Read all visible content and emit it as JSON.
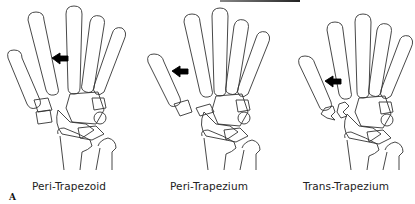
{
  "figure": {
    "label": "A",
    "panels": [
      {
        "caption": "Peri-Trapezoid",
        "injury": "peri-trapezoid",
        "arrow_direction": "left"
      },
      {
        "caption": "Peri-Trapezium",
        "injury": "peri-trapezium",
        "arrow_direction": "left"
      },
      {
        "caption": "Trans-Trapezium",
        "injury": "trans-trapezium",
        "arrow_direction": "left"
      }
    ],
    "colors": {
      "line": "#333333",
      "arrow": "#000000",
      "background": "#ffffff"
    }
  }
}
